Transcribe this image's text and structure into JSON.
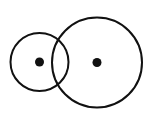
{
  "diagram": {
    "background": "#ffffff",
    "stroke_color": "#111111",
    "circles": [
      {
        "name": "small-circle",
        "cx": 39.5,
        "cy": 62,
        "r": 29,
        "dot_r": 4.5
      },
      {
        "name": "large-circle",
        "cx": 97,
        "cy": 62.5,
        "r": 45,
        "dot_r": 4.5
      }
    ]
  }
}
